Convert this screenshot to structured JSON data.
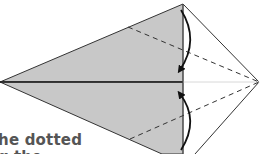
{
  "diagram": {
    "type": "origami-fold-step",
    "caption_line1": "he dotted",
    "caption_line2": "g the",
    "colors": {
      "paper_back": "#c8c8c8",
      "paper_front": "#ffffff",
      "outline": "#333333",
      "text": "#555555"
    },
    "elements": [
      {
        "kind": "gray-flap-upper",
        "label": "folded flap (top)"
      },
      {
        "kind": "gray-flap-lower",
        "label": "folded flap (bottom)"
      },
      {
        "kind": "dashed-fold-line-upper"
      },
      {
        "kind": "dashed-fold-line-lower"
      },
      {
        "kind": "fold-arrow-down"
      },
      {
        "kind": "fold-arrow-up"
      }
    ]
  }
}
